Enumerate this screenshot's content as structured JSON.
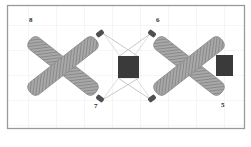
{
  "figure": {
    "title": "",
    "canvas": {
      "width": 251,
      "height": 147
    },
    "background_color": "#ffffff",
    "frame": {
      "border_color": "#9a9a9a",
      "x": 7,
      "y": 5,
      "width": 238,
      "height": 124
    },
    "grid": {
      "visible": true,
      "color": "#f2f2f2",
      "spacing_x": 28,
      "spacing_y": 25
    }
  },
  "labels": [
    {
      "id": "label-8",
      "text": "8",
      "x": 29,
      "y": 17,
      "color": "#2b2b2b"
    },
    {
      "id": "label-6",
      "text": "6",
      "x": 156,
      "y": 17,
      "color": "#2b2b2b"
    },
    {
      "id": "label-7",
      "text": "7",
      "x": 94,
      "y": 103,
      "color": "#2b2b2b"
    },
    {
      "id": "label-5",
      "text": "5",
      "x": 221,
      "y": 102,
      "color": "#2b2b2b"
    }
  ],
  "shapes": {
    "crosses": [
      {
        "id": "cross-left",
        "center_x": 63,
        "center_y": 66,
        "half_span": 42,
        "arm_width": 15,
        "fill_color": "#a8a8a8",
        "hatch_color": "#6f6f6f",
        "edge_color": "#8a8a8a",
        "cap_color": "#4a4a4a"
      },
      {
        "id": "cross-right",
        "center_x": 189,
        "center_y": 66,
        "half_span": 42,
        "arm_width": 15,
        "fill_color": "#a8a8a8",
        "hatch_color": "#6f6f6f",
        "edge_color": "#8a8a8a",
        "cap_color": "#4a4a4a"
      }
    ],
    "blocks": [
      {
        "id": "block-center",
        "x": 118,
        "y": 56,
        "width": 21,
        "height": 22,
        "fill_color": "#3a3a3a"
      },
      {
        "id": "block-right",
        "x": 216,
        "y": 55,
        "width": 17,
        "height": 21,
        "fill_color": "#3a3a3a"
      }
    ],
    "connectors": [
      {
        "id": "connector-upper-left",
        "x1": 104,
        "y1": 34,
        "x2": 128,
        "y2": 57,
        "color": "#bdbdbd"
      },
      {
        "id": "connector-lower-left",
        "x1": 104,
        "y1": 98,
        "x2": 128,
        "y2": 77,
        "color": "#bdbdbd"
      },
      {
        "id": "connector-upper-right",
        "x1": 150,
        "y1": 34,
        "x2": 129,
        "y2": 57,
        "color": "#bdbdbd"
      },
      {
        "id": "connector-lower-right",
        "x1": 150,
        "y1": 98,
        "x2": 129,
        "y2": 77,
        "color": "#bdbdbd"
      },
      {
        "id": "connector-diagonal-a",
        "x1": 104,
        "y1": 34,
        "x2": 150,
        "y2": 98,
        "color": "#d2d2d2"
      },
      {
        "id": "connector-diagonal-b",
        "x1": 104,
        "y1": 98,
        "x2": 150,
        "y2": 34,
        "color": "#d2d2d2"
      }
    ]
  }
}
